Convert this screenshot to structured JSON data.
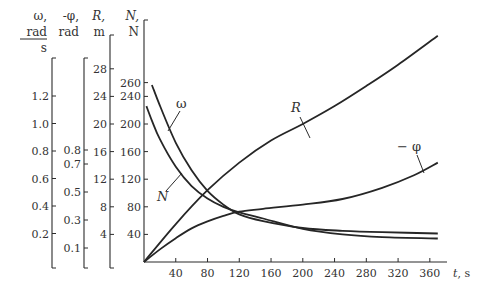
{
  "chart_data": {
    "type": "line",
    "title": "",
    "xlabel": "t, s",
    "x_ticks": [
      40,
      80,
      120,
      160,
      200,
      240,
      280,
      320,
      360
    ],
    "xlim": [
      0,
      375
    ],
    "axes": [
      {
        "id": "omega",
        "label_lines": [
          "ω,",
          "rad",
          "s"
        ],
        "label_fraction": true,
        "ticks": [
          0.2,
          0.4,
          0.6,
          0.8,
          1.0,
          1.2
        ],
        "tick_labels": [
          "0.2",
          "0.4",
          "0.6",
          "0.8",
          "1.0",
          "1.2"
        ]
      },
      {
        "id": "phi",
        "label_lines": [
          "-φ,",
          "rad"
        ],
        "ticks": [
          0.1,
          0.3,
          0.5,
          0.7,
          0.8
        ],
        "tick_labels": [
          "0.1",
          "0.3",
          "0.5",
          "0.7",
          "0.8"
        ]
      },
      {
        "id": "R",
        "label_lines": [
          "R,",
          "m"
        ],
        "ticks": [
          4,
          8,
          12,
          16,
          20,
          24,
          28
        ],
        "tick_labels": [
          "4",
          "8",
          "12",
          "16",
          "20",
          "24",
          "28"
        ]
      },
      {
        "id": "N",
        "label_lines": [
          "N,",
          "N"
        ],
        "ticks": [
          40,
          80,
          120,
          160,
          200,
          240,
          260
        ],
        "tick_labels": [
          "40",
          "80",
          "120",
          "160",
          "200",
          "240",
          "260"
        ]
      }
    ],
    "series": [
      {
        "name": "ω",
        "axis": "omega",
        "unit": "rad/s",
        "x": [
          10,
          20,
          40,
          60,
          80,
          100,
          120,
          150,
          200,
          250,
          300,
          370
        ],
        "values": [
          1.28,
          1.13,
          0.86,
          0.66,
          0.51,
          0.41,
          0.34,
          0.29,
          0.24,
          0.22,
          0.21,
          0.2
        ]
      },
      {
        "name": "N",
        "axis": "N",
        "unit": "N",
        "x": [
          3,
          10,
          20,
          40,
          60,
          80,
          100,
          120,
          150,
          200,
          250,
          300,
          370
        ],
        "values": [
          226,
          205,
          178,
          138,
          110,
          92,
          80,
          72,
          63,
          48,
          40,
          36,
          34
        ]
      },
      {
        "name": "R",
        "axis": "R",
        "unit": "m",
        "x": [
          0,
          40,
          80,
          120,
          160,
          200,
          240,
          280,
          320,
          370
        ],
        "values": [
          0,
          5.5,
          10.4,
          14.4,
          17.6,
          20.0,
          22.6,
          25.5,
          28.6,
          32.8
        ]
      },
      {
        "name": "-φ",
        "axis": "phi",
        "unit": "rad",
        "x": [
          0,
          20,
          40,
          60,
          80,
          100,
          120,
          150,
          200,
          250,
          300,
          340,
          370
        ],
        "values": [
          0,
          0.09,
          0.17,
          0.24,
          0.29,
          0.33,
          0.36,
          0.38,
          0.41,
          0.45,
          0.53,
          0.62,
          0.71
        ]
      }
    ],
    "curve_labels": [
      "ω",
      "N",
      "R",
      "− φ"
    ],
    "grid": false,
    "legend": "inline labels with leader lines"
  }
}
